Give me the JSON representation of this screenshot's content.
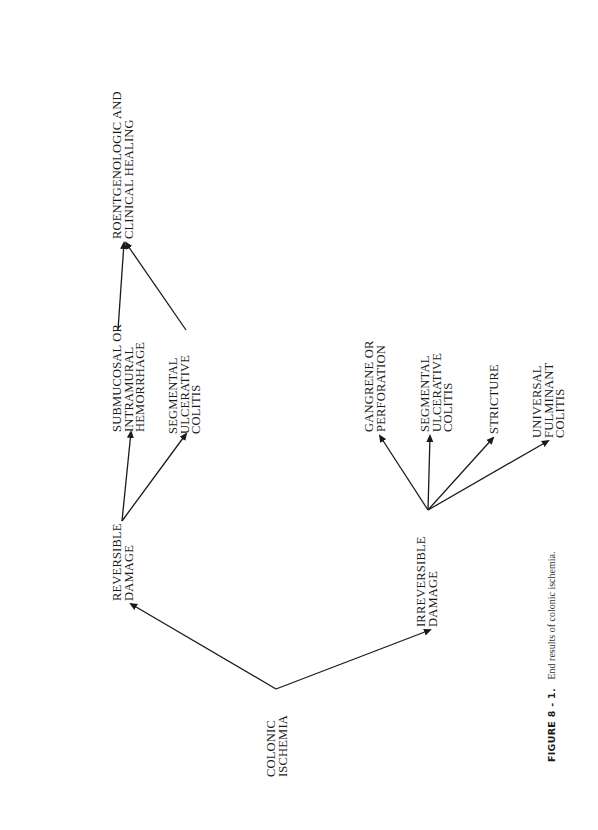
{
  "figure": {
    "number": "FIGURE 8 - 1.",
    "caption": "End results of colonic ischemia."
  },
  "nodes": {
    "colonic_ischemia": {
      "lines": [
        "COLONIC",
        "ISCHEMIA"
      ]
    },
    "reversible_damage": {
      "lines": [
        "REVERSIBLE",
        "DAMAGE"
      ]
    },
    "irreversible_damage": {
      "lines": [
        "IRREVERSIBLE",
        "DAMAGE"
      ]
    },
    "submucosal_hemorrhage": {
      "lines": [
        "SUBMUCOSAL OR",
        "INTRAMURAL",
        "HEMORRHAGE"
      ]
    },
    "segmental_colitis_reversible": {
      "lines": [
        "SEGMENTAL",
        "ULCERATIVE",
        "COLITIS"
      ]
    },
    "healing": {
      "lines": [
        "ROENTGENOLOGIC AND",
        "CLINICAL HEALING"
      ]
    },
    "gangrene": {
      "lines": [
        "GANGRENE OR",
        "PERFORATION"
      ]
    },
    "segmental_colitis_irreversible": {
      "lines": [
        "SEGMENTAL",
        "ULCERATIVE",
        "COLITIS"
      ]
    },
    "stricture": {
      "lines": [
        "STRICTURE"
      ]
    },
    "universal_colitis": {
      "lines": [
        "UNIVERSAL",
        "FULMINANT",
        "COLITIS"
      ]
    }
  },
  "edges": [
    {
      "from": "COLONIC ISCHEMIA",
      "to": "REVERSIBLE DAMAGE"
    },
    {
      "from": "COLONIC ISCHEMIA",
      "to": "IRREVERSIBLE DAMAGE"
    },
    {
      "from": "REVERSIBLE DAMAGE",
      "to": "SUBMUCOSAL OR INTRAMURAL HEMORRHAGE"
    },
    {
      "from": "REVERSIBLE DAMAGE",
      "to": "SEGMENTAL ULCERATIVE COLITIS"
    },
    {
      "from": "SUBMUCOSAL OR INTRAMURAL HEMORRHAGE",
      "to": "ROENTGENOLOGIC AND CLINICAL HEALING"
    },
    {
      "from": "SEGMENTAL ULCERATIVE COLITIS",
      "to": "ROENTGENOLOGIC AND CLINICAL HEALING"
    },
    {
      "from": "IRREVERSIBLE DAMAGE",
      "to": "GANGRENE OR PERFORATION"
    },
    {
      "from": "IRREVERSIBLE DAMAGE",
      "to": "SEGMENTAL ULCERATIVE COLITIS"
    },
    {
      "from": "IRREVERSIBLE DAMAGE",
      "to": "STRICTURE"
    },
    {
      "from": "IRREVERSIBLE DAMAGE",
      "to": "UNIVERSAL FULMINANT COLITIS"
    }
  ],
  "colors": {
    "ink": "#1a1a1a",
    "background": "#ffffff"
  }
}
